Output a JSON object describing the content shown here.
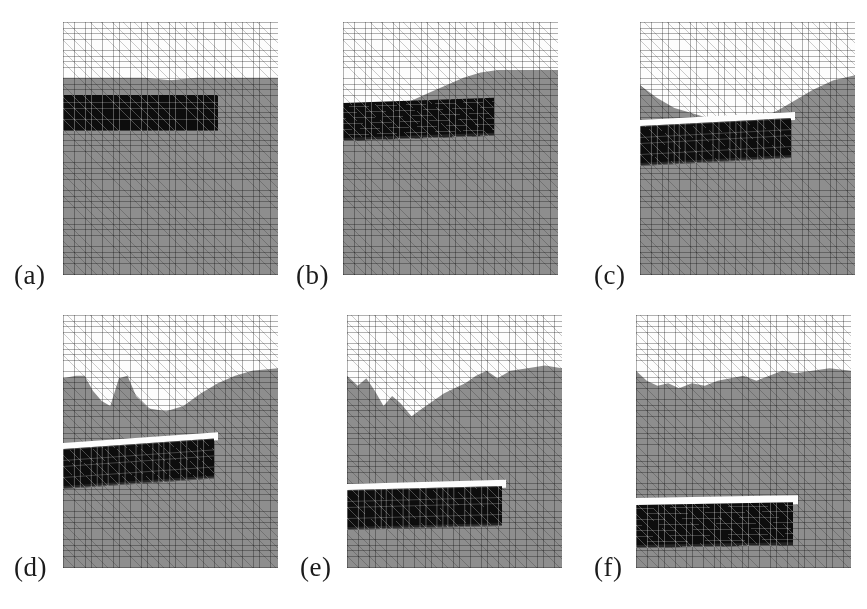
{
  "figure": {
    "type": "multi-panel-simulation-montage",
    "rows": 2,
    "columns": 3,
    "canvas_width": 867,
    "canvas_height": 609,
    "background_color": "#ffffff"
  },
  "palette": {
    "void_white": "#fdfdfd",
    "solid_grey": "#8e8e8e",
    "dense_black": "#0d0d0d",
    "mesh_line": "#4a4a4a",
    "label_text": "#1b1b1b",
    "page_background": "#ffffff"
  },
  "mesh": {
    "element_type": "triangular",
    "cell_size_px": 5.6,
    "visible": true
  },
  "panels": [
    {
      "id": "a",
      "label": "(a)",
      "frame_index": 1,
      "left": 63,
      "top": 22,
      "width": 215,
      "height": 253,
      "label_left": 14,
      "label_top": 262,
      "surface": {
        "style": "flat",
        "mean_depth_pct": 22,
        "roughness": "none",
        "points": "0,22 12,22 25,22 38,22 50,23 62,22 75,22 88,22 100,22"
      },
      "insert": {
        "left_pct": 0,
        "top_pct": 29,
        "width_pct": 72,
        "height_pct": 14,
        "tilt_deg": 0,
        "shape": "rectangular",
        "void_gap_above": false,
        "eroded_bottom": false
      }
    },
    {
      "id": "b",
      "label": "(b)",
      "frame_index": 2,
      "left": 343,
      "top": 22,
      "width": 215,
      "height": 253,
      "label_left": 296,
      "label_top": 262,
      "surface": {
        "style": "gentle-wave",
        "mean_depth_pct": 26,
        "roughness": "low",
        "points": "0,34 8,35 16,34 24,33 32,31 40,28 48,25 56,22 64,20 72,19 80,19 88,19 100,19"
      },
      "insert": {
        "left_pct": 0,
        "top_pct": 32,
        "width_pct": 70,
        "height_pct": 15,
        "tilt_deg": 2.0,
        "shape": "sheared",
        "void_gap_above": false,
        "eroded_bottom": true
      }
    },
    {
      "id": "c",
      "label": "(c)",
      "frame_index": 3,
      "left": 640,
      "top": 22,
      "width": 215,
      "height": 253,
      "label_left": 594,
      "label_top": 262,
      "surface": {
        "style": "dished",
        "mean_depth_pct": 28,
        "roughness": "medium",
        "points": "0,25 8,30 16,34 24,36 32,38 40,40 48,40 56,38 64,35 72,31 80,27 90,23 100,21"
      },
      "insert": {
        "left_pct": 0,
        "top_pct": 41,
        "width_pct": 70,
        "height_pct": 16,
        "tilt_deg": 3.0,
        "shape": "sheared",
        "void_gap_above": true,
        "eroded_bottom": true
      }
    },
    {
      "id": "d",
      "label": "(d)",
      "frame_index": 4,
      "left": 63,
      "top": 315,
      "width": 215,
      "height": 253,
      "label_left": 14,
      "label_top": 554,
      "surface": {
        "style": "jagged-notch",
        "mean_depth_pct": 30,
        "roughness": "high",
        "points": "0,25 6,24 10,24 14,30 18,34 22,36 26,25 30,24 34,32 40,37 48,38 56,36 64,31 72,27 80,24 88,22 100,21"
      },
      "insert": {
        "left_pct": 0,
        "top_pct": 53,
        "width_pct": 70,
        "height_pct": 16,
        "tilt_deg": 4.0,
        "shape": "sheared",
        "void_gap_above": true,
        "eroded_bottom": true
      }
    },
    {
      "id": "e",
      "label": "(e)",
      "frame_index": 5,
      "left": 347,
      "top": 315,
      "width": 215,
      "height": 253,
      "label_left": 300,
      "label_top": 554,
      "surface": {
        "style": "highly-irregular",
        "mean_depth_pct": 32,
        "roughness": "very-high",
        "points": "0,24 5,28 9,25 13,30 17,36 21,32 25,35 30,40 35,37 40,34 45,31 50,29 55,27 60,24 65,22 70,25 76,22 84,21 92,20 100,21"
      },
      "insert": {
        "left_pct": 0,
        "top_pct": 69,
        "width_pct": 72,
        "height_pct": 16,
        "tilt_deg": 1.5,
        "shape": "sheared",
        "void_gap_above": true,
        "eroded_bottom": true
      }
    },
    {
      "id": "f",
      "label": "(f)",
      "frame_index": 6,
      "left": 636,
      "top": 315,
      "width": 215,
      "height": 253,
      "label_left": 594,
      "label_top": 554,
      "surface": {
        "style": "rough-crest",
        "mean_depth_pct": 26,
        "roughness": "very-high",
        "points": "0,22 5,26 10,28 15,27 20,29 26,27 32,28 38,26 44,25 50,24 56,26 62,24 68,22 74,23 82,22 90,21 100,22"
      },
      "insert": {
        "left_pct": 0,
        "top_pct": 75,
        "width_pct": 73,
        "height_pct": 17,
        "tilt_deg": 1.0,
        "shape": "sheared",
        "void_gap_above": true,
        "eroded_bottom": true
      }
    }
  ]
}
